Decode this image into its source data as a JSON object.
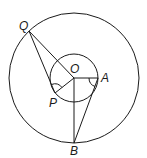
{
  "diagram": {
    "type": "geometry",
    "large_circle": {
      "cx": 74,
      "cy": 78,
      "r": 65
    },
    "small_circle": {
      "cx": 74,
      "cy": 78,
      "r": 24
    },
    "points": {
      "Q": {
        "label": "Q",
        "x": 29,
        "y": 31
      },
      "O": {
        "label": "O",
        "x": 74,
        "y": 78
      },
      "A": {
        "label": "A",
        "x": 98,
        "y": 78
      },
      "P": {
        "label": "P",
        "x": 55,
        "y": 93
      },
      "B": {
        "label": "B",
        "x": 74,
        "y": 143
      }
    },
    "segments": [
      [
        "Q",
        "O"
      ],
      [
        "Q",
        "P"
      ],
      [
        "O",
        "P"
      ],
      [
        "O",
        "A"
      ],
      [
        "O",
        "B"
      ],
      [
        "A",
        "B"
      ]
    ],
    "angle_marks": [
      {
        "vertex": "P",
        "between": [
          "Q",
          "O"
        ]
      },
      {
        "vertex": "A",
        "between": [
          "O",
          "B"
        ]
      }
    ]
  }
}
